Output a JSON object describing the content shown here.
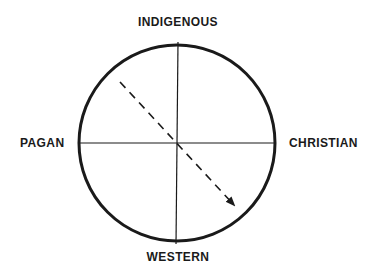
{
  "diagram": {
    "labels": {
      "top": "INDIGENOUS",
      "bottom": "WESTERN",
      "left": "PAGAN",
      "right": "CHRISTIAN"
    },
    "arrow": {
      "style": "dashed",
      "direction": "from upper-left (Pagan/Indigenous quadrant) to lower-right (Christian/Western quadrant)"
    },
    "colors": {
      "stroke": "#1a1a1a",
      "background": "#ffffff"
    }
  }
}
